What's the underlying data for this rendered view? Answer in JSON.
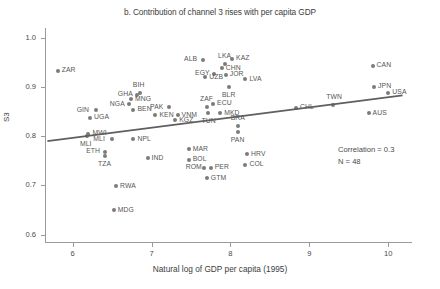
{
  "chart_data": {
    "type": "scatter",
    "title": "b. Contribution of channel 3 rises with per capita GDP",
    "xlabel": "Natural log of GDP per capita (1995)",
    "ylabel": "S3",
    "xlim": [
      5.65,
      10.3
    ],
    "ylim": [
      0.585,
      1.02
    ],
    "xticks": [
      6,
      7,
      8,
      9,
      10
    ],
    "xtick_labels": [
      "6",
      "7",
      "8",
      "9",
      "10"
    ],
    "yticks": [
      0.6,
      0.7,
      0.8,
      0.9,
      1.0
    ],
    "ytick_labels": [
      "0.6",
      "0.7",
      "0.8",
      "0.9",
      "1.0"
    ],
    "grid": false,
    "legend": null,
    "marker_color": "#7b7b7b",
    "trendline_color": "#5f5f5f",
    "points": [
      {
        "label": "ZAR",
        "x": 5.81,
        "y": 0.933,
        "label_pos": "right"
      },
      {
        "label": "GIN",
        "x": 6.29,
        "y": 0.853,
        "label_pos": "left"
      },
      {
        "label": "UGA",
        "x": 6.22,
        "y": 0.838,
        "label_pos": "right"
      },
      {
        "label": "NGA",
        "x": 6.71,
        "y": 0.865,
        "label_pos": "left"
      },
      {
        "label": "GHA",
        "x": 6.81,
        "y": 0.884,
        "label_pos": "left"
      },
      {
        "label": "BIH",
        "x": 6.85,
        "y": 0.888,
        "label_pos": "above"
      },
      {
        "label": "MNG",
        "x": 6.74,
        "y": 0.875,
        "label_pos": "right"
      },
      {
        "label": "BEN",
        "x": 6.77,
        "y": 0.854,
        "label_pos": "right"
      },
      {
        "label": "MWI",
        "x": 6.2,
        "y": 0.805,
        "label_pos": "right"
      },
      {
        "label": "MLI",
        "x": 6.18,
        "y": 0.8,
        "label_pos": "below"
      },
      {
        "label": "MLI2",
        "x": 6.5,
        "y": 0.794,
        "label_pos": "left"
      },
      {
        "label": "NPL",
        "x": 6.77,
        "y": 0.794,
        "label_pos": "right"
      },
      {
        "label": "ETH",
        "x": 6.41,
        "y": 0.768,
        "label_pos": "left"
      },
      {
        "label": "TZA",
        "x": 6.41,
        "y": 0.76,
        "label_pos": "below"
      },
      {
        "label": "RWA",
        "x": 6.55,
        "y": 0.698,
        "label_pos": "right"
      },
      {
        "label": "MDG",
        "x": 6.52,
        "y": 0.65,
        "label_pos": "right"
      },
      {
        "label": "KEN",
        "x": 7.05,
        "y": 0.843,
        "label_pos": "right"
      },
      {
        "label": "VNM",
        "x": 7.33,
        "y": 0.843,
        "label_pos": "right"
      },
      {
        "label": "KGZ",
        "x": 7.3,
        "y": 0.832,
        "label_pos": "right"
      },
      {
        "label": "PAK",
        "x": 7.22,
        "y": 0.859,
        "label_pos": "left"
      },
      {
        "label": "IND",
        "x": 6.95,
        "y": 0.755,
        "label_pos": "right"
      },
      {
        "label": "ALB",
        "x": 7.65,
        "y": 0.955,
        "label_pos": "left"
      },
      {
        "label": "LKA",
        "x": 7.93,
        "y": 0.946,
        "label_pos": "above"
      },
      {
        "label": "CHN",
        "x": 7.89,
        "y": 0.938,
        "label_pos": "right"
      },
      {
        "label": "EGY",
        "x": 7.79,
        "y": 0.927,
        "label_pos": "left"
      },
      {
        "label": "UZB",
        "x": 7.68,
        "y": 0.92,
        "label_pos": "right"
      },
      {
        "label": "JOR",
        "x": 7.94,
        "y": 0.925,
        "label_pos": "right"
      },
      {
        "label": "KAZ",
        "x": 8.02,
        "y": 0.957,
        "label_pos": "right"
      },
      {
        "label": "LVA",
        "x": 8.19,
        "y": 0.916,
        "label_pos": "right"
      },
      {
        "label": "BLR",
        "x": 7.98,
        "y": 0.901,
        "label_pos": "below"
      },
      {
        "label": "ZAF",
        "x": 7.7,
        "y": 0.86,
        "label_pos": "above"
      },
      {
        "label": "ECU",
        "x": 7.78,
        "y": 0.866,
        "label_pos": "right"
      },
      {
        "label": "TUN",
        "x": 7.72,
        "y": 0.848,
        "label_pos": "below"
      },
      {
        "label": "MKD",
        "x": 7.87,
        "y": 0.847,
        "label_pos": "right"
      },
      {
        "label": "BRA",
        "x": 8.09,
        "y": 0.821,
        "label_pos": "above"
      },
      {
        "label": "PAN",
        "x": 8.09,
        "y": 0.808,
        "label_pos": "below"
      },
      {
        "label": "MAR",
        "x": 7.47,
        "y": 0.774,
        "label_pos": "right"
      },
      {
        "label": "BOL",
        "x": 7.47,
        "y": 0.752,
        "label_pos": "right"
      },
      {
        "label": "ROM",
        "x": 7.67,
        "y": 0.736,
        "label_pos": "left"
      },
      {
        "label": "PER",
        "x": 7.75,
        "y": 0.736,
        "label_pos": "right"
      },
      {
        "label": "GTM",
        "x": 7.7,
        "y": 0.715,
        "label_pos": "right"
      },
      {
        "label": "HRV",
        "x": 8.21,
        "y": 0.763,
        "label_pos": "right"
      },
      {
        "label": "COL",
        "x": 8.19,
        "y": 0.742,
        "label_pos": "right"
      },
      {
        "label": "CHL",
        "x": 8.83,
        "y": 0.858,
        "label_pos": "right"
      },
      {
        "label": "TWN",
        "x": 9.3,
        "y": 0.864,
        "label_pos": "above"
      },
      {
        "label": "AUS",
        "x": 9.75,
        "y": 0.847,
        "label_pos": "right"
      },
      {
        "label": "CAN",
        "x": 9.8,
        "y": 0.943,
        "label_pos": "right"
      },
      {
        "label": "JPN",
        "x": 9.82,
        "y": 0.901,
        "label_pos": "right"
      },
      {
        "label": "USA",
        "x": 10.0,
        "y": 0.888,
        "label_pos": "right"
      }
    ],
    "trendline": {
      "x0": 5.68,
      "y0": 0.79,
      "x1": 10.18,
      "y1": 0.883
    },
    "annotations": [
      "Correlation = 0.3",
      "N = 48"
    ]
  }
}
